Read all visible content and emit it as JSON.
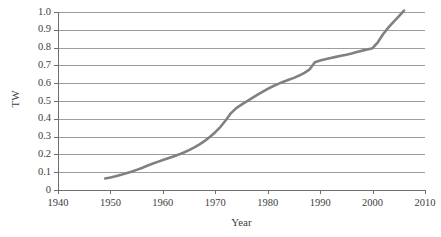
{
  "figure": {
    "background_color": "#ffffff",
    "width": 441,
    "height": 237
  },
  "chart_data": {
    "type": "line",
    "title": "",
    "subtitle": "",
    "xlabel": "Year",
    "ylabel": "TW",
    "xlim": [
      1940,
      2010
    ],
    "ylim": [
      0,
      1.0
    ],
    "xticks": [
      1940,
      1950,
      1960,
      1970,
      1980,
      1990,
      2000,
      2010
    ],
    "xtick_labels": [
      "1940",
      "1950",
      "1960",
      "1970",
      "1980",
      "1990",
      "2000",
      "2010"
    ],
    "yticks": [
      0,
      0.1,
      0.2,
      0.3,
      0.4,
      0.5,
      0.6,
      0.7,
      0.8,
      0.9,
      1.0
    ],
    "ytick_labels": [
      "0",
      "0.1",
      "0.2",
      "0.3",
      "0.4",
      "0.5",
      "0.6",
      "0.7",
      "0.8",
      "0.9",
      "1.0"
    ],
    "grid": "horizontal",
    "legend": "none",
    "line_color": "#808080",
    "line_width": 2.6,
    "grid_color": "#9e9e9e",
    "axis_color": "#6e6e6e",
    "series": [
      {
        "name": "Installed capacity (TW)",
        "x": [
          1949,
          1950,
          1951,
          1952,
          1953,
          1954,
          1955,
          1956,
          1957,
          1958,
          1959,
          1960,
          1961,
          1962,
          1963,
          1964,
          1965,
          1966,
          1967,
          1968,
          1969,
          1970,
          1971,
          1972,
          1973,
          1974,
          1975,
          1976,
          1977,
          1978,
          1979,
          1980,
          1981,
          1982,
          1983,
          1984,
          1985,
          1986,
          1987,
          1988,
          1989,
          1990,
          1991,
          1992,
          1993,
          1994,
          1995,
          1996,
          1997,
          1998,
          1999,
          2000,
          2001,
          2002,
          2003,
          2004,
          2005,
          2006
        ],
        "y": [
          0.065,
          0.07,
          0.077,
          0.085,
          0.094,
          0.103,
          0.113,
          0.124,
          0.136,
          0.147,
          0.158,
          0.168,
          0.178,
          0.188,
          0.199,
          0.211,
          0.224,
          0.239,
          0.256,
          0.276,
          0.299,
          0.325,
          0.355,
          0.392,
          0.432,
          0.46,
          0.48,
          0.498,
          0.516,
          0.534,
          0.551,
          0.568,
          0.583,
          0.596,
          0.608,
          0.619,
          0.63,
          0.643,
          0.658,
          0.678,
          0.718,
          0.727,
          0.735,
          0.742,
          0.748,
          0.754,
          0.76,
          0.767,
          0.775,
          0.783,
          0.789,
          0.797,
          0.83,
          0.875,
          0.912,
          0.945,
          0.975,
          1.008
        ]
      }
    ]
  },
  "axes_geometry": {
    "left": 58,
    "right": 425,
    "top": 12,
    "bottom": 190
  }
}
